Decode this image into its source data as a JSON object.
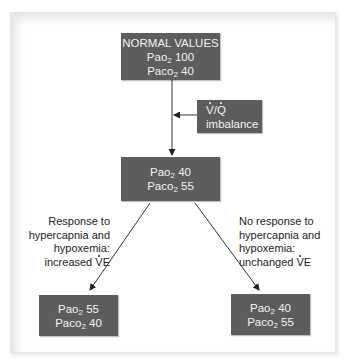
{
  "diagram": {
    "top_box": {
      "title": "NORMAL VALUES",
      "pao2_label": "Pao",
      "pao2_sub": "2",
      "pao2_value": "100",
      "paco2_label": "Paco",
      "paco2_sub": "2",
      "paco2_value": "40"
    },
    "vq_box": {
      "line1_v": "V",
      "line1_sep": "/",
      "line1_q": "Q",
      "line2": "imbalance"
    },
    "middle_box": {
      "pao2_label": "Pao",
      "pao2_sub": "2",
      "pao2_value": "40",
      "paco2_label": "Paco",
      "paco2_sub": "2",
      "paco2_value": "55"
    },
    "left_label": {
      "lines": [
        "Response to",
        "hypercapnia and",
        "hypoxemia:"
      ],
      "last_prefix": "increased ",
      "last_v": "V",
      "last_suffix": "E"
    },
    "right_label": {
      "lines": [
        "No response to",
        "hypercapnia and",
        "hypoxemia:"
      ],
      "last_prefix": "unchanged ",
      "last_v": "V",
      "last_suffix": "E"
    },
    "bottom_left_box": {
      "pao2_label": "Pao",
      "pao2_sub": "2",
      "pao2_value": "55",
      "paco2_label": "Paco",
      "paco2_sub": "2",
      "paco2_value": "40"
    },
    "bottom_right_box": {
      "pao2_label": "Pao",
      "pao2_sub": "2",
      "pao2_value": "40",
      "paco2_label": "Paco",
      "paco2_sub": "2",
      "paco2_value": "55"
    },
    "colors": {
      "box_fill": "#5d5d5d",
      "box_text": "#f2f2f2",
      "arrow": "#222222",
      "label_text": "#222222"
    }
  }
}
